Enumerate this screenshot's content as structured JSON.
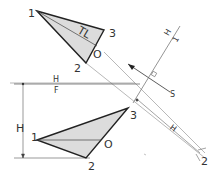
{
  "diagram": {
    "type": "descriptive-geometry-auxiliary-view",
    "colors": {
      "line": "#222222",
      "thin": "#888888",
      "fill": "#dcdcdc",
      "background": "#ffffff"
    },
    "top_view": {
      "vertices": {
        "p1": "1",
        "p2": "2",
        "p3": "3",
        "o": "O"
      },
      "true_length_label": "TL"
    },
    "front_view": {
      "vertices": {
        "p1": "1",
        "p2": "2",
        "p3": "3",
        "o": "O"
      }
    },
    "fold_line_hf": {
      "upper": "H",
      "lower": "F"
    },
    "auxiliary_fold_line": {
      "upper": "H",
      "lower": "1"
    },
    "sight_direction_label": "S",
    "edge_view": {
      "point_label": "2",
      "dim_label": "H"
    },
    "height_dimension_label": "H"
  }
}
